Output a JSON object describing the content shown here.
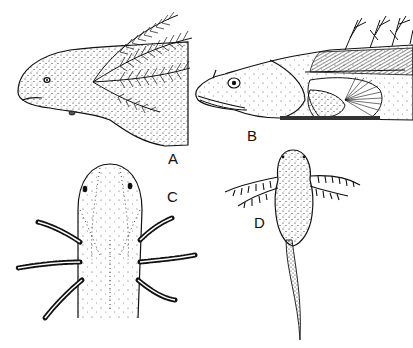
{
  "figure": {
    "panels": [
      {
        "id": "A",
        "label": "A",
        "subject": "larva head, lateral view, with feathery external gills"
      },
      {
        "id": "B",
        "label": "B",
        "subject": "fish larva head, lateral view, with gill filaments and pectoral fin"
      },
      {
        "id": "C",
        "label": "C",
        "subject": "larva head, dorsal view, with bushy external gills on both sides"
      },
      {
        "id": "D",
        "label": "D",
        "subject": "whole larva, dorsal view, with branched external gills and long tail"
      }
    ],
    "colors": {
      "ink": "#111111",
      "background": "#ffffff"
    }
  }
}
